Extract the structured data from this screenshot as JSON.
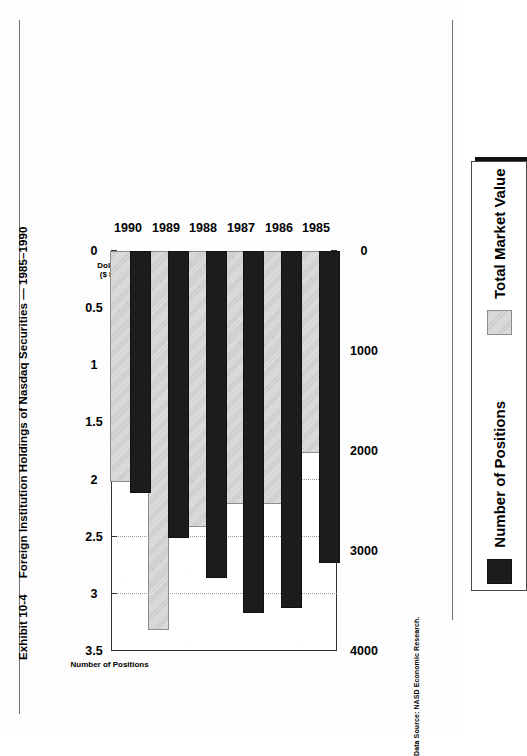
{
  "exhibit": {
    "number": "Exhibit 10-4",
    "title": "Foreign Institution Holdings of Nasdaq Securities — 1985–1990"
  },
  "source_note": "Data Source: NASD Economic Research.",
  "legend": {
    "items": [
      {
        "label": "Number of Positions",
        "color": "#1c1c1c",
        "swatch": "black-swatch"
      },
      {
        "label": "Total Market Value",
        "color": "#c9c9c9",
        "swatch": "gray-swatch"
      }
    ]
  },
  "axes": {
    "dollar_caption_line1": "Dollar Value",
    "dollar_caption_line2": "($ Billions)",
    "positions_caption": "Number of  Positions",
    "dollar_ticks": [
      "3.5",
      "3",
      "2.5",
      "2",
      "1.5",
      "1",
      "0.5",
      "0"
    ],
    "positions_ticks": [
      "4000",
      "3000",
      "2000",
      "1000",
      "0"
    ]
  },
  "chart_data": {
    "type": "bar",
    "orientation": "horizontal",
    "title": "Exhibit 10-4  Foreign Institution Holdings of Nasdaq Securities — 1985–1990",
    "categories": [
      "1985",
      "1986",
      "1987",
      "1988",
      "1989",
      "1990"
    ],
    "series": [
      {
        "name": "Number of Positions",
        "color": "#1c1c1c",
        "axis": "bottom",
        "values": [
          3100,
          3550,
          3600,
          3250,
          2850,
          2400
        ]
      },
      {
        "name": "Total Market Value",
        "color": "#c9c9c9",
        "axis": "top",
        "unit": "$ Billions",
        "values": [
          1.75,
          2.2,
          2.2,
          2.4,
          3.3,
          2.0
        ]
      }
    ],
    "xlabel_top": "Dollar Value ($ Billions)",
    "xlabel_bottom": "Number of  Positions",
    "ylabel": "",
    "top_axis_ticks": [
      3.5,
      3,
      2.5,
      2,
      1.5,
      1,
      0.5,
      0
    ],
    "top_axis_range": [
      0,
      3.5
    ],
    "bottom_axis_ticks": [
      4000,
      3000,
      2000,
      1000,
      0
    ],
    "bottom_axis_range": [
      0,
      4000
    ],
    "grid": "vertical-dotted",
    "legend_position": "right",
    "source": "Data Source: NASD Economic Research."
  }
}
